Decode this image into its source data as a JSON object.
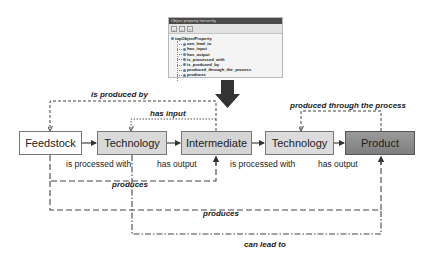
{
  "property_panel": {
    "title": "Object property hierarchy",
    "toolbar": [
      "add-sub-property",
      "add-sibling-property",
      "delete-property"
    ],
    "root": "topObjectProperty",
    "children": [
      "can_lead_to",
      "has_input",
      "has_output",
      "is_processed_with",
      "is_produced_by",
      "produced_through_the_process",
      "produces"
    ]
  },
  "nodes": {
    "feedstock": "Feedstock",
    "technology1": "Technology",
    "intermediate": "Intermediate",
    "technology2": "Technology",
    "product": "Product"
  },
  "relations": {
    "is_produced_by": "is produced by",
    "has_input": "has input",
    "produced_through_the_process": "produced through the process",
    "is_processed_with_1": "is processed with",
    "has_output_1": "has output",
    "is_processed_with_2": "is processed with",
    "has_output_2": "has output",
    "produces_inner": "produces",
    "produces_outer": "produces",
    "can_lead_to": "can lead to"
  },
  "colors": {
    "feedstock_fill": "#ffffff",
    "technology_fill": "#d9d9d9",
    "intermediate_fill": "#d4d4d4",
    "product_fill": "#8c8c8c",
    "arrow": "#333333"
  }
}
